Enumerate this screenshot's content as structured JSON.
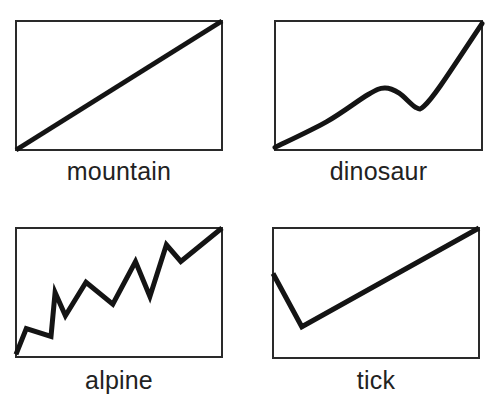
{
  "chart_data": {
    "type": "line",
    "title": "",
    "xlim": [
      0,
      1
    ],
    "ylim": [
      0,
      1
    ],
    "grid": false,
    "panels": [
      {
        "name": "mountain",
        "label": "mountain",
        "smooth": false,
        "points": [
          [
            0,
            0
          ],
          [
            1,
            1
          ]
        ]
      },
      {
        "name": "dinosaur",
        "label": "dinosaur",
        "smooth": true,
        "points": [
          [
            0,
            0.02
          ],
          [
            0.25,
            0.22
          ],
          [
            0.45,
            0.43
          ],
          [
            0.53,
            0.48
          ],
          [
            0.6,
            0.44
          ],
          [
            0.68,
            0.33
          ],
          [
            0.72,
            0.34
          ],
          [
            0.8,
            0.5
          ],
          [
            1,
            0.98
          ]
        ]
      },
      {
        "name": "alpine",
        "label": "alpine",
        "smooth": false,
        "points": [
          [
            0,
            0.02
          ],
          [
            0.05,
            0.22
          ],
          [
            0.17,
            0.16
          ],
          [
            0.19,
            0.5
          ],
          [
            0.24,
            0.32
          ],
          [
            0.34,
            0.58
          ],
          [
            0.47,
            0.41
          ],
          [
            0.58,
            0.74
          ],
          [
            0.65,
            0.47
          ],
          [
            0.73,
            0.87
          ],
          [
            0.8,
            0.74
          ],
          [
            1,
            1
          ]
        ]
      },
      {
        "name": "tick",
        "label": "tick",
        "smooth": false,
        "points": [
          [
            0,
            0.65
          ],
          [
            0.14,
            0.24
          ],
          [
            1,
            1
          ]
        ]
      }
    ]
  }
}
